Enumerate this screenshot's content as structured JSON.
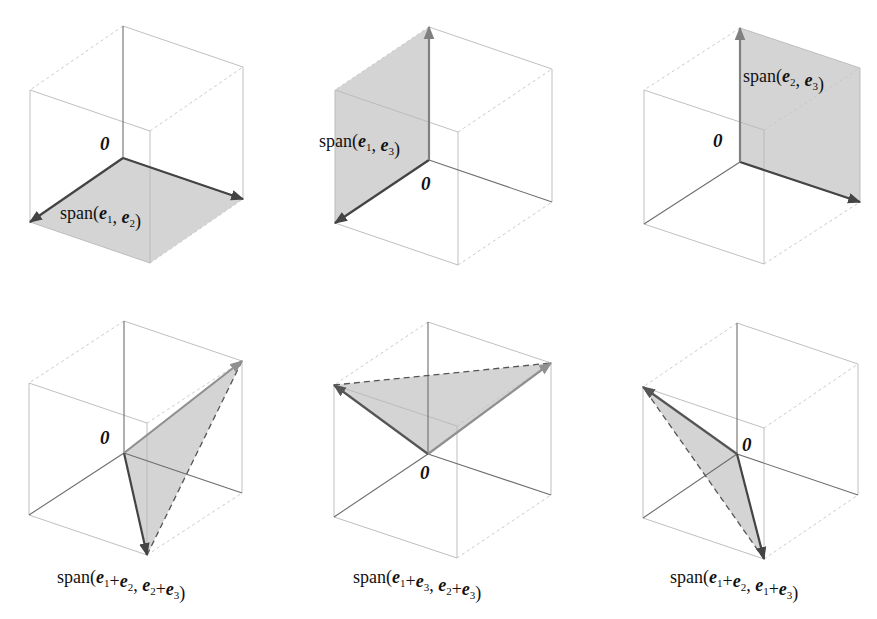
{
  "figure": {
    "colors": {
      "plane_fill": "#cfcfcf",
      "edge": "#b8b8b8",
      "axis": "#6e6e6e",
      "vector_dark": "#444444",
      "vector_light": "#808080"
    },
    "origin_label": "0",
    "panels": [
      {
        "id": "span-e1-e2",
        "label": [
          {
            "t": "span("
          },
          {
            "b": "e"
          },
          {
            "s": "1"
          },
          {
            "t": ", "
          },
          {
            "b": "e"
          },
          {
            "s": "2"
          },
          {
            "t": ")"
          }
        ],
        "label_pos": [
          60,
          219
        ],
        "zero_pos": [
          100,
          150
        ],
        "origin": [
          123,
          158
        ],
        "e1": [
          -93,
          64
        ],
        "e2": [
          120,
          41
        ],
        "e3": [
          0,
          -132
        ],
        "plane": "e1,e2",
        "vectors": [
          {
            "v": "e1",
            "color": "#444444"
          },
          {
            "v": "e2",
            "color": "#444444"
          }
        ],
        "dashed_span": false
      },
      {
        "id": "span-e1-e3",
        "label": [
          {
            "t": "span("
          },
          {
            "b": "e"
          },
          {
            "s": "1"
          },
          {
            "t": ", "
          },
          {
            "b": "e"
          },
          {
            "s": "3"
          },
          {
            "t": ")"
          }
        ],
        "label_pos": [
          319,
          147
        ],
        "zero_pos": [
          421,
          190
        ],
        "origin": [
          429,
          160
        ],
        "e1": [
          -94,
          63
        ],
        "e2": [
          123,
          42
        ],
        "e3": [
          0,
          -133
        ],
        "plane": "e1,e3",
        "vectors": [
          {
            "v": "e1",
            "color": "#444444"
          },
          {
            "v": "e3",
            "color": "#808080"
          }
        ],
        "dashed_span": false
      },
      {
        "id": "span-e2-e3",
        "label": [
          {
            "t": "span("
          },
          {
            "b": "e"
          },
          {
            "s": "2"
          },
          {
            "t": ", "
          },
          {
            "b": "e"
          },
          {
            "s": "3"
          },
          {
            "t": ")"
          }
        ],
        "label_pos": [
          743,
          82
        ],
        "zero_pos": [
          713,
          147
        ],
        "origin": [
          740,
          162
        ],
        "e1": [
          -96,
          62
        ],
        "e2": [
          120,
          40
        ],
        "e3": [
          0,
          -134
        ],
        "plane": "e2,e3",
        "vectors": [
          {
            "v": "e2",
            "color": "#444444"
          },
          {
            "v": "e3",
            "color": "#808080"
          }
        ],
        "dashed_span": false
      },
      {
        "id": "span-e1pe2-e2pe3",
        "label": [
          {
            "t": "span("
          },
          {
            "b": "e"
          },
          {
            "s": "1"
          },
          {
            "t": "+"
          },
          {
            "b": "e"
          },
          {
            "s": "2"
          },
          {
            "t": ", "
          },
          {
            "b": "e"
          },
          {
            "s": "2"
          },
          {
            "t": "+"
          },
          {
            "b": "e"
          },
          {
            "s": "3"
          },
          {
            "t": ")"
          }
        ],
        "label_pos": [
          57,
          583
        ],
        "zero_pos": [
          100,
          444
        ],
        "origin": [
          124,
          453
        ],
        "e1": [
          -95,
          62
        ],
        "e2": [
          118,
          40
        ],
        "e3": [
          0,
          -132
        ],
        "plane": "e1+e2,e2+e3",
        "vectors": [
          {
            "v": "e1+e2",
            "color": "#444444"
          },
          {
            "v": "e2+e3",
            "color": "#909090"
          }
        ],
        "dashed_span": true
      },
      {
        "id": "span-e1pe3-e2pe3",
        "label": [
          {
            "t": "span("
          },
          {
            "b": "e"
          },
          {
            "s": "1"
          },
          {
            "t": "+"
          },
          {
            "b": "e"
          },
          {
            "s": "3"
          },
          {
            "t": ", "
          },
          {
            "b": "e"
          },
          {
            "s": "2"
          },
          {
            "t": "+"
          },
          {
            "b": "e"
          },
          {
            "s": "3"
          },
          {
            "t": ")"
          }
        ],
        "label_pos": [
          353,
          583
        ],
        "zero_pos": [
          420,
          479
        ],
        "origin": [
          428,
          454
        ],
        "e1": [
          -94,
          63
        ],
        "e2": [
          123,
          41
        ],
        "e3": [
          0,
          -132
        ],
        "plane": "e1+e3,e2+e3",
        "vectors": [
          {
            "v": "e1+e3",
            "color": "#555555"
          },
          {
            "v": "e2+e3",
            "color": "#909090"
          }
        ],
        "dashed_span": true
      },
      {
        "id": "span-e1pe2-e1pe3",
        "label": [
          {
            "t": "span("
          },
          {
            "b": "e"
          },
          {
            "s": "1"
          },
          {
            "t": "+"
          },
          {
            "b": "e"
          },
          {
            "s": "2"
          },
          {
            "t": ", "
          },
          {
            "b": "e"
          },
          {
            "s": "1"
          },
          {
            "t": "+"
          },
          {
            "b": "e"
          },
          {
            "s": "3"
          },
          {
            "t": ")"
          }
        ],
        "label_pos": [
          670,
          583
        ],
        "zero_pos": [
          742,
          451
        ],
        "origin": [
          737,
          454
        ],
        "e1": [
          -94,
          64
        ],
        "e2": [
          121,
          41
        ],
        "e3": [
          0,
          -131
        ],
        "plane": "e1+e2,e1+e3",
        "vectors": [
          {
            "v": "e1+e2",
            "color": "#444444"
          },
          {
            "v": "e1+e3",
            "color": "#555555"
          }
        ],
        "dashed_span": true
      }
    ]
  }
}
